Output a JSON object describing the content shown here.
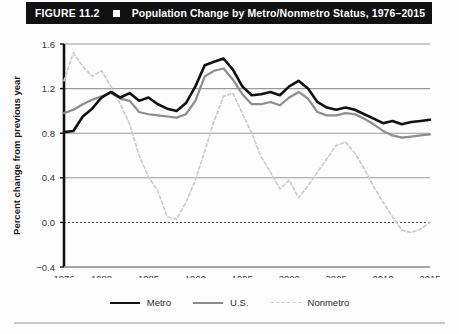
{
  "header": {
    "figure_number": "FIGURE 11.2",
    "marker_icon": "square-bullet-icon",
    "title": "Population Change by Metro/Nonmetro Status, 1976–2015",
    "bar_color": "#111111",
    "text_color": "#ffffff"
  },
  "legend": {
    "position": "bottom-center",
    "items": [
      {
        "label": "Metro",
        "color": "#111111",
        "style": "solid",
        "width": 2.6
      },
      {
        "label": "U.S.",
        "color": "#8d8d8d",
        "style": "solid",
        "width": 2.2
      },
      {
        "label": "Nonmetro",
        "color": "#cccccc",
        "style": "dashed",
        "width": 1.8
      }
    ]
  },
  "chart_data": {
    "type": "line",
    "title": "Population Change by Metro/Nonmetro Status, 1976–2015",
    "xlabel": "",
    "ylabel": "Percent change from previous year",
    "xlim": [
      1976,
      2015
    ],
    "ylim": [
      -0.4,
      1.6
    ],
    "yticks": [
      -0.4,
      0.0,
      0.4,
      0.8,
      1.2,
      1.6
    ],
    "ytick_labels": [
      "−0.4",
      "0.0",
      "0.4",
      "0.8",
      "1.2",
      "1.6"
    ],
    "xticks": [
      1976,
      1980,
      1985,
      1990,
      1995,
      2000,
      2005,
      2010,
      2015
    ],
    "xtick_labels": [
      "1976",
      "1980",
      "1985",
      "1990",
      "1995",
      "2000",
      "2005",
      "2010",
      "2015"
    ],
    "grid": "horizontal",
    "zero_line": true,
    "x": [
      1976,
      1977,
      1978,
      1979,
      1980,
      1981,
      1982,
      1983,
      1984,
      1985,
      1986,
      1987,
      1988,
      1989,
      1990,
      1991,
      1992,
      1993,
      1994,
      1995,
      1996,
      1997,
      1998,
      1999,
      2000,
      2001,
      2002,
      2003,
      2004,
      2005,
      2006,
      2007,
      2008,
      2009,
      2010,
      2011,
      2012,
      2013,
      2014,
      2015
    ],
    "series": [
      {
        "name": "Metro",
        "color": "#111111",
        "style": "solid",
        "values": [
          0.81,
          0.82,
          0.95,
          1.02,
          1.12,
          1.17,
          1.12,
          1.16,
          1.09,
          1.12,
          1.06,
          1.02,
          1.0,
          1.07,
          1.22,
          1.41,
          1.44,
          1.47,
          1.37,
          1.22,
          1.14,
          1.15,
          1.17,
          1.14,
          1.22,
          1.27,
          1.2,
          1.08,
          1.03,
          1.01,
          1.03,
          1.01,
          0.97,
          0.93,
          0.89,
          0.91,
          0.88,
          0.9,
          0.91,
          0.92
        ]
      },
      {
        "name": "U.S.",
        "color": "#8d8d8d",
        "style": "solid",
        "values": [
          0.98,
          1.01,
          1.06,
          1.1,
          1.13,
          1.16,
          1.11,
          1.09,
          0.99,
          0.97,
          0.96,
          0.95,
          0.94,
          0.97,
          1.09,
          1.31,
          1.36,
          1.38,
          1.28,
          1.15,
          1.06,
          1.06,
          1.08,
          1.05,
          1.12,
          1.17,
          1.11,
          0.99,
          0.96,
          0.96,
          0.98,
          0.97,
          0.93,
          0.88,
          0.82,
          0.78,
          0.76,
          0.77,
          0.78,
          0.79
        ]
      },
      {
        "name": "Nonmetro",
        "color": "#cccccc",
        "style": "dashed",
        "values": [
          1.27,
          1.52,
          1.4,
          1.31,
          1.36,
          1.22,
          1.06,
          0.88,
          0.6,
          0.41,
          0.28,
          0.05,
          0.03,
          0.18,
          0.38,
          0.64,
          0.91,
          1.13,
          1.16,
          0.98,
          0.8,
          0.59,
          0.45,
          0.3,
          0.38,
          0.22,
          0.33,
          0.45,
          0.57,
          0.69,
          0.72,
          0.62,
          0.48,
          0.32,
          0.18,
          0.05,
          -0.07,
          -0.09,
          -0.06,
          0.0
        ]
      }
    ]
  }
}
